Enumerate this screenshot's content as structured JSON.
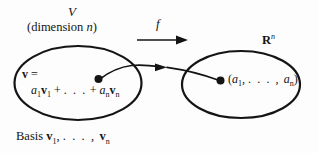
{
  "figure": {
    "type": "math-diagram",
    "background_color": "#fdfdfd",
    "ink_color": "#141414"
  },
  "domain": {
    "name": "V",
    "dimension_text": "(dimension ",
    "dimension_symbol": "n",
    "dimension_close": ")",
    "ellipse": {
      "cx": 78,
      "cy": 83,
      "rx": 64,
      "ry": 37
    },
    "vector_lhs": "v",
    "vector_lhs_eq": " =",
    "expansion": {
      "coef1": "a",
      "coef1_sub": "1",
      "basis1": "v",
      "basis1_sub": "1",
      "plus": " + ",
      "ellipsis": ". . .",
      "plus2": " + ",
      "coefn": "a",
      "coefn_sub": "n",
      "basisn": "v",
      "basisn_sub": "n"
    },
    "point_label": "vector-point"
  },
  "basis_caption": {
    "prefix": "Basis ",
    "vector": "v",
    "sub1": "1",
    "comma": ", ",
    "ellipsis": ". . . ,",
    "vector_last": "v",
    "subn": "n"
  },
  "map": {
    "name": "f",
    "arrow": {
      "x1": 137,
      "y1": 40,
      "x2": 186,
      "y2": 40
    }
  },
  "codomain": {
    "name": "R",
    "exponent": "n",
    "ellipse": {
      "cx": 241,
      "cy": 84,
      "rx": 59,
      "ry": 34
    },
    "tuple": {
      "open": "(",
      "first": "a",
      "first_sub": "1",
      "comma": ", ",
      "ellipsis": ". . . ,",
      "last": "a",
      "last_sub": "n",
      "close": ")"
    },
    "point_label": "image-point"
  },
  "curved_map_arrow": {
    "from": {
      "x": 98,
      "y": 79
    },
    "to": {
      "x": 220,
      "y": 80
    },
    "apex": {
      "x": 160,
      "y": 67
    },
    "arrowhead_at": {
      "x": 162,
      "y": 67
    }
  }
}
